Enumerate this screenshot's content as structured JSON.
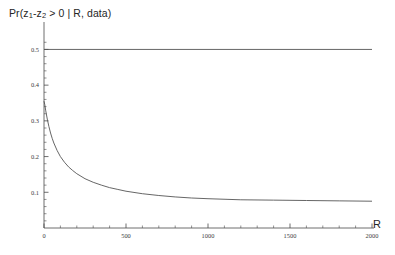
{
  "figure": {
    "title_prefix": "Pr(z",
    "title_sub1": "1",
    "title_mid": "-z",
    "title_sub2": "2",
    "title_suffix": " > 0 | R, data)",
    "title_plain": "Pr(z1-z2 > 0 | R, data)",
    "x_axis_name": "R",
    "background_color": "#ffffff",
    "axis_color": "#4a4a4a",
    "curve_color": "#555555"
  },
  "chart_data": {
    "type": "line",
    "title": "Pr(z1-z2 > 0 | R, data)",
    "xlabel": "R",
    "ylabel": "",
    "xlim": [
      0,
      2000
    ],
    "ylim": [
      0,
      0.56
    ],
    "grid": false,
    "legend": "none",
    "xticks": [
      0,
      500,
      1000,
      1500,
      2000
    ],
    "xtick_labels": [
      "0",
      "500",
      "1000",
      "1500",
      "2000"
    ],
    "xminor_step": 100,
    "yticks": [
      0.1,
      0.2,
      0.3,
      0.4,
      0.5
    ],
    "ytick_labels": [
      "0.1",
      "0.2",
      "0.3",
      "0.4",
      "0.5"
    ],
    "yminor_step": 0.02,
    "series": [
      {
        "name": "reference-line",
        "style": "solid",
        "x": [
          0,
          2000
        ],
        "values": [
          0.5,
          0.5
        ]
      },
      {
        "name": "posterior-probability",
        "style": "solid",
        "x": [
          0,
          5,
          10,
          20,
          30,
          40,
          50,
          60,
          80,
          100,
          125,
          150,
          175,
          200,
          250,
          300,
          350,
          400,
          450,
          500,
          600,
          700,
          800,
          900,
          1000,
          1200,
          1400,
          1600,
          1800,
          2000
        ],
        "values": [
          0.355,
          0.345,
          0.33,
          0.305,
          0.284,
          0.266,
          0.251,
          0.238,
          0.217,
          0.2,
          0.184,
          0.171,
          0.161,
          0.152,
          0.138,
          0.128,
          0.12,
          0.113,
          0.108,
          0.103,
          0.096,
          0.091,
          0.087,
          0.084,
          0.082,
          0.079,
          0.078,
          0.077,
          0.076,
          0.075
        ]
      }
    ],
    "annotations": [
      {
        "name": "asymptote-value",
        "value": 0.075
      },
      {
        "name": "start-value",
        "value": 0.355
      },
      {
        "name": "reference-value",
        "value": 0.5
      }
    ]
  }
}
